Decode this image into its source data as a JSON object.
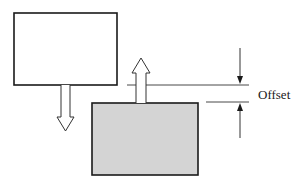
{
  "diagram": {
    "label": "Offset",
    "colors": {
      "stroke": "#1a1a1a",
      "line": "#333333",
      "top_box_fill": "#ffffff",
      "bottom_box_fill": "#d4d4d4",
      "arrow_fill": "#ffffff"
    },
    "elements": {
      "top_box": {
        "x": 14,
        "y": 13,
        "w": 103,
        "h": 72
      },
      "bottom_box": {
        "x": 92,
        "y": 103,
        "w": 106,
        "h": 72
      },
      "down_arrow": {
        "direction": "down"
      },
      "up_arrow": {
        "direction": "up"
      },
      "dimension": {
        "name": "Offset"
      }
    }
  }
}
